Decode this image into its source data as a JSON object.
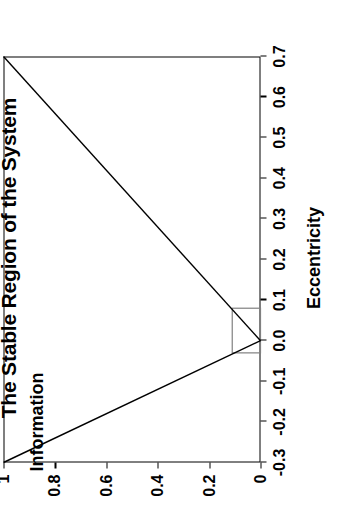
{
  "chart_data": {
    "type": "line",
    "title": "The Stable Region of the System",
    "xlabel": "Eccentricity",
    "ylabel": "Information",
    "xlim": [
      -0.3,
      0.7
    ],
    "ylim": [
      0,
      1
    ],
    "xticks": [
      "-0.3",
      "-0.2",
      "-0.1",
      "0.0",
      "0.1",
      "0.2",
      "0.3",
      "0.4",
      "0.5",
      "0.6",
      "0.7"
    ],
    "xtick_values": [
      -0.3,
      -0.2,
      -0.1,
      0.0,
      0.1,
      0.2,
      0.3,
      0.4,
      0.5,
      0.6,
      0.7
    ],
    "yticks": [
      "0",
      "0.2",
      "0.4",
      "0.6",
      "0.8",
      "1"
    ],
    "ytick_values": [
      0,
      0.2,
      0.4,
      0.6,
      0.8,
      1
    ],
    "grid": false,
    "legend": null,
    "series": [
      {
        "name": "left-branch",
        "color": "#000000",
        "x": [
          -0.3,
          0.0
        ],
        "values": [
          1.0,
          0.0
        ]
      },
      {
        "name": "right-branch",
        "color": "#000000",
        "x": [
          0.0,
          0.7
        ],
        "values": [
          0.0,
          1.0
        ]
      }
    ],
    "annotations": [
      {
        "name": "stable-region-box",
        "type": "rect",
        "color": "#808080",
        "x0": -0.03,
        "x1": 0.08,
        "y0": 0.0,
        "y1": 0.11
      }
    ]
  },
  "chart": {
    "title": "The Stable Region of the System",
    "xlabel": "Eccentricity",
    "ylabel": "Information",
    "colors": {
      "line": "#000000",
      "box": "#808080",
      "axis": "#000000",
      "background": "#ffffff"
    }
  }
}
